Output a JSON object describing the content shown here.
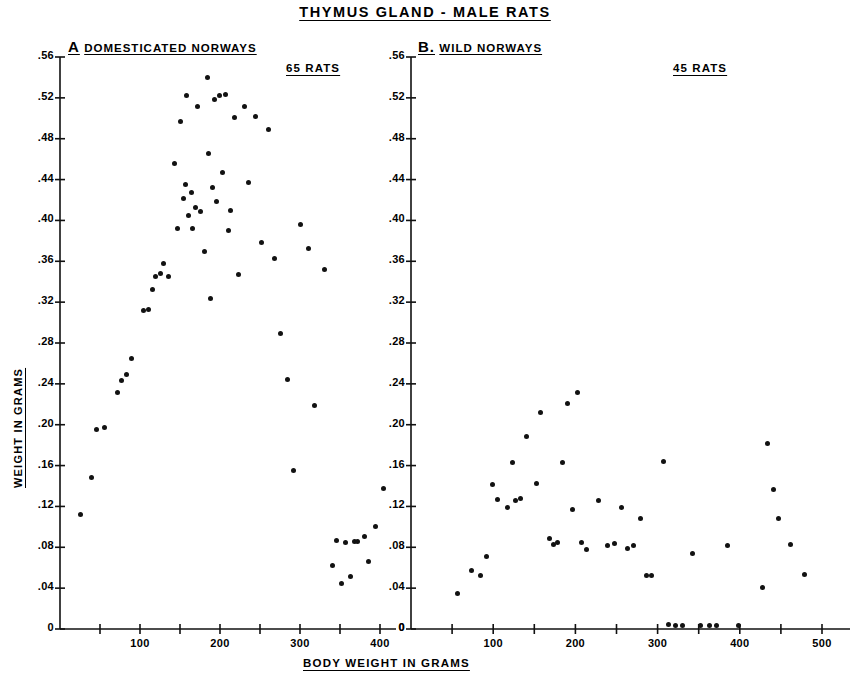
{
  "figure": {
    "title": "THYMUS GLAND - MALE RATS",
    "xlabel": "BODY WEIGHT IN GRAMS",
    "ylabel": "WEIGHT IN GRAMS"
  },
  "panelA": {
    "letter": "A",
    "name": "DOMESTICATED  NORWAYS",
    "count": "65 RATS"
  },
  "panelB": {
    "letter": "B.",
    "name": "WILD  NORWAYS",
    "count": "45 RATS"
  },
  "yticks": [
    ".56",
    ".52",
    ".48",
    ".44",
    ".40",
    ".36",
    ".32",
    ".28",
    ".24",
    ".20",
    ".16",
    ".12",
    ".08",
    ".04",
    "0"
  ],
  "xticksA": [
    "100",
    "200",
    "300",
    "400"
  ],
  "xticksB": [
    "100",
    "200",
    "300",
    "400",
    "500"
  ],
  "chart_data": [
    {
      "type": "scatter",
      "title": "A  DOMESTICATED  NORWAYS",
      "annotation": "65 RATS",
      "xlabel": "BODY WEIGHT IN GRAMS",
      "ylabel": "WEIGHT IN GRAMS",
      "xlim": [
        0,
        420
      ],
      "ylim": [
        0,
        0.56
      ],
      "xticks": [
        50,
        100,
        150,
        200,
        250,
        300,
        350,
        400
      ],
      "xticklabels": [
        "",
        "100",
        "",
        "200",
        "",
        "300",
        "",
        "400"
      ],
      "yticks": [
        0,
        0.04,
        0.08,
        0.12,
        0.16,
        0.2,
        0.24,
        0.28,
        0.32,
        0.36,
        0.4,
        0.44,
        0.48,
        0.52,
        0.56
      ],
      "grid": false,
      "n_points": 65,
      "points": [
        [
          26,
          0.112
        ],
        [
          39,
          0.148
        ],
        [
          46,
          0.195
        ],
        [
          55,
          0.197
        ],
        [
          72,
          0.232
        ],
        [
          77,
          0.243
        ],
        [
          83,
          0.249
        ],
        [
          89,
          0.265
        ],
        [
          104,
          0.312
        ],
        [
          110,
          0.313
        ],
        [
          116,
          0.332
        ],
        [
          119,
          0.345
        ],
        [
          125,
          0.348
        ],
        [
          129,
          0.358
        ],
        [
          136,
          0.345
        ],
        [
          143,
          0.456
        ],
        [
          147,
          0.392
        ],
        [
          150,
          0.497
        ],
        [
          154,
          0.421
        ],
        [
          157,
          0.435
        ],
        [
          158,
          0.522
        ],
        [
          161,
          0.405
        ],
        [
          164,
          0.427
        ],
        [
          166,
          0.392
        ],
        [
          169,
          0.413
        ],
        [
          172,
          0.512
        ],
        [
          176,
          0.409
        ],
        [
          180,
          0.37
        ],
        [
          184,
          0.54
        ],
        [
          186,
          0.466
        ],
        [
          188,
          0.324
        ],
        [
          191,
          0.432
        ],
        [
          193,
          0.518
        ],
        [
          196,
          0.419
        ],
        [
          199,
          0.522
        ],
        [
          203,
          0.447
        ],
        [
          207,
          0.523
        ],
        [
          210,
          0.39
        ],
        [
          213,
          0.41
        ],
        [
          218,
          0.501
        ],
        [
          223,
          0.347
        ],
        [
          231,
          0.512
        ],
        [
          236,
          0.437
        ],
        [
          244,
          0.502
        ],
        [
          252,
          0.378
        ],
        [
          261,
          0.489
        ],
        [
          268,
          0.363
        ],
        [
          276,
          0.289
        ],
        [
          284,
          0.244
        ],
        [
          292,
          0.155
        ],
        [
          301,
          0.396
        ],
        [
          311,
          0.373
        ],
        [
          318,
          0.219
        ],
        [
          331,
          0.352
        ],
        [
          341,
          0.062
        ],
        [
          345,
          0.087
        ],
        [
          352,
          0.045
        ],
        [
          357,
          0.085
        ],
        [
          363,
          0.051
        ],
        [
          368,
          0.086
        ],
        [
          372,
          0.086
        ],
        [
          380,
          0.091
        ],
        [
          386,
          0.066
        ],
        [
          394,
          0.1
        ],
        [
          404,
          0.138
        ]
      ]
    },
    {
      "type": "scatter",
      "title": "B. WILD NORWAYS",
      "annotation": "45 RATS",
      "xlabel": "BODY WEIGHT IN GRAMS",
      "ylabel": "WEIGHT IN GRAMS",
      "xlim": [
        0,
        540
      ],
      "ylim": [
        0,
        0.56
      ],
      "xticks": [
        50,
        100,
        150,
        200,
        250,
        300,
        350,
        400,
        450,
        500
      ],
      "xticklabels": [
        "",
        "100",
        "",
        "200",
        "",
        "300",
        "",
        "400",
        "",
        "500"
      ],
      "yticks": [
        0,
        0.04,
        0.08,
        0.12,
        0.16,
        0.2,
        0.24,
        0.28,
        0.32,
        0.36,
        0.4,
        0.44,
        0.48,
        0.52,
        0.56
      ],
      "grid": false,
      "n_points": 45,
      "points": [
        [
          56,
          0.035
        ],
        [
          73,
          0.057
        ],
        [
          84,
          0.052
        ],
        [
          92,
          0.071
        ],
        [
          99,
          0.141
        ],
        [
          105,
          0.127
        ],
        [
          118,
          0.119
        ],
        [
          123,
          0.163
        ],
        [
          127,
          0.126
        ],
        [
          133,
          0.128
        ],
        [
          141,
          0.188
        ],
        [
          153,
          0.142
        ],
        [
          158,
          0.212
        ],
        [
          168,
          0.089
        ],
        [
          173,
          0.083
        ],
        [
          178,
          0.085
        ],
        [
          184,
          0.163
        ],
        [
          190,
          0.221
        ],
        [
          196,
          0.117
        ],
        [
          203,
          0.232
        ],
        [
          208,
          0.085
        ],
        [
          213,
          0.078
        ],
        [
          228,
          0.126
        ],
        [
          239,
          0.082
        ],
        [
          248,
          0.084
        ],
        [
          256,
          0.119
        ],
        [
          263,
          0.079
        ],
        [
          271,
          0.082
        ],
        [
          279,
          0.108
        ],
        [
          286,
          0.052
        ],
        [
          293,
          0.052
        ],
        [
          307,
          0.164
        ],
        [
          313,
          0.004
        ],
        [
          322,
          0.003
        ],
        [
          330,
          0.003
        ],
        [
          342,
          0.074
        ],
        [
          352,
          0.003
        ],
        [
          363,
          0.003
        ],
        [
          372,
          0.003
        ],
        [
          385,
          0.082
        ],
        [
          398,
          0.003
        ],
        [
          428,
          0.041
        ],
        [
          434,
          0.182
        ],
        [
          441,
          0.137
        ],
        [
          447,
          0.108
        ],
        [
          462,
          0.083
        ],
        [
          479,
          0.053
        ]
      ]
    }
  ]
}
